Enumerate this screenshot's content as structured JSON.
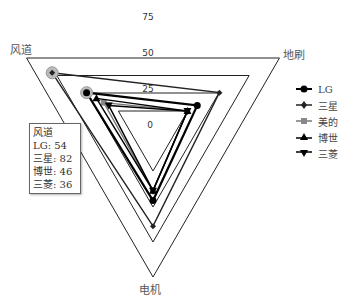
{
  "chart_data": {
    "type": "radar",
    "title": "",
    "axes": [
      "风道",
      "地刷",
      "电机"
    ],
    "tick_labels": [
      "0",
      "25",
      "50",
      "75"
    ],
    "series": [
      {
        "name": "LG",
        "marker": "circle",
        "values": [
          54,
          36,
          49
        ]
      },
      {
        "name": "三星",
        "marker": "diamond",
        "values": [
          82,
          54,
          67
        ]
      },
      {
        "name": "美的",
        "marker": "square",
        "values": [
          40,
          28,
          42
        ]
      },
      {
        "name": "博世",
        "marker": "triangle-up",
        "values": [
          46,
          28,
          42
        ]
      },
      {
        "name": "三菱",
        "marker": "triangle-down",
        "values": [
          36,
          28,
          42
        ]
      }
    ],
    "legend_position": "right",
    "grid": true
  },
  "tooltip": {
    "title": "风道",
    "lines": [
      "LG: 54",
      "三星: 82",
      "博世: 46",
      "三菱: 36"
    ]
  }
}
